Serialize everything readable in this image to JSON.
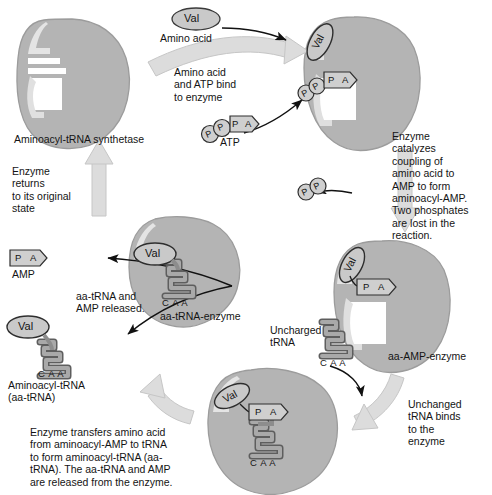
{
  "diagram": {
    "colors": {
      "enzyme_fill": "#b4b4b4",
      "enzyme_edge": "#8d8d8d",
      "enzyme_highlight": "#d6d6d6",
      "arrow_fill": "#d9d9d9",
      "arrow_edge": "#b9b9b9",
      "molecule_fill": "#cfcfcf",
      "molecule_edge": "#6b6b6b",
      "trna_fill": "#9a9a9a",
      "trna_edge": "#5e5e5e",
      "text": "#141414"
    }
  },
  "labels": {
    "amino_acid_residue": "Val",
    "amino_acid": "Amino acid",
    "atp": "ATP",
    "amp": "AMP",
    "synthetase": "Aminoacyl-tRNA synthetase",
    "anticodon": "C A A",
    "phosphate": "P",
    "adenosine": "A",
    "aa_amp_enzyme": "aa-AMP-enzyme",
    "aa_trna_enzyme": "aa-tRNA-enzyme",
    "aminoacyl_trna_line1": "Aminoacyl-tRNA",
    "aminoacyl_trna_line2": "(aa-tRNA)",
    "uncharged_trna_line1": "Uncharged",
    "uncharged_trna_line2": "tRNA"
  },
  "steps": {
    "bind": "Amino acid\nand ATP bind\nto enzyme",
    "catalyze": "Enzyme\ncatalyzes\ncoupling of\namino acid to\nAMP to form\naminoacyl-AMP.\nTwo phosphates\nare lost in the\nreaction.",
    "trna_binds": "Unchanged\ntRNA binds\nto the\nenzyme",
    "transfer": "Enzyme transfers amino acid\nfrom aminoacyl-AMP to tRNA\nto form aminoacyl-tRNA (aa-\ntRNA). The aa-tRNA and AMP\nare released from the enzyme.",
    "released": "aa-tRNA and\nAMP released.",
    "returns": "Enzyme\nreturns\nto its original\nstate"
  }
}
